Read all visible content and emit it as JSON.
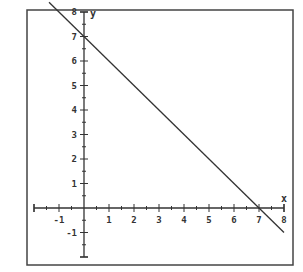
{
  "chart_data": {
    "type": "line",
    "title": "",
    "xlabel": "x",
    "ylabel": "y",
    "xlim": [
      -2,
      8
    ],
    "ylim": [
      -2,
      8
    ],
    "x_ticks": [
      -1,
      1,
      2,
      3,
      4,
      5,
      6,
      7,
      8
    ],
    "y_ticks": [
      -1,
      1,
      2,
      3,
      4,
      5,
      6,
      7,
      8
    ],
    "minor_ticks": "half-unit",
    "grid": false,
    "legend": "none",
    "series": [
      {
        "name": "y = 7 - x",
        "equation": "y = -x + 7",
        "slope": -1,
        "intercept": 7,
        "x_intercept": 7,
        "points": [
          [
            -1.4,
            8.4
          ],
          [
            0,
            7
          ],
          [
            7,
            0
          ],
          [
            8,
            -1
          ]
        ]
      }
    ],
    "colors": {
      "line": "#333333",
      "axes": "#333333",
      "frame": "#333333",
      "background": "#ffffff"
    }
  }
}
